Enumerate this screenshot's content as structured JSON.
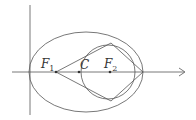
{
  "diagram": {
    "type": "geometry",
    "stroke_color": "#555555",
    "labels": {
      "f1": {
        "main": "F",
        "sub": "1"
      },
      "c": {
        "main": "C"
      },
      "f2": {
        "main": "F",
        "sub": "2"
      }
    },
    "points": {
      "F1": [
        56,
        72
      ],
      "C": [
        79,
        72
      ],
      "F2": [
        110,
        72
      ]
    },
    "ellipse": {
      "cx": 86,
      "cy": 72,
      "rx": 57,
      "ry": 40
    },
    "circle": {
      "cx": 108,
      "cy": 72,
      "r": 27
    },
    "quadrilateral": [
      [
        56,
        72
      ],
      [
        111,
        43
      ],
      [
        143,
        72
      ],
      [
        111,
        101
      ]
    ],
    "axes": {
      "x": {
        "from": [
          12,
          72
        ],
        "to": [
          185,
          72
        ],
        "arrow": true
      },
      "y": {
        "from": [
          30,
          5
        ],
        "to": [
          30,
          115
        ],
        "arrow": false
      }
    }
  }
}
